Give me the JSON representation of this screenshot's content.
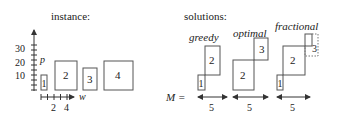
{
  "instance": {
    "title": "instance:",
    "y_axis": {
      "label": "p",
      "ticks": [
        "10",
        "20",
        "30"
      ]
    },
    "x_axis": {
      "label": "w",
      "ticks": [
        "2",
        "4"
      ]
    },
    "items": [
      {
        "id": "1",
        "w": 1,
        "p": 10
      },
      {
        "id": "2",
        "w": 4,
        "p": 20
      },
      {
        "id": "3",
        "w": 2,
        "p": 15
      },
      {
        "id": "4",
        "w": 5,
        "p": 20
      }
    ]
  },
  "solutions": {
    "title": "solutions:",
    "capacity_label": "M =",
    "panels": [
      {
        "name": "greedy",
        "items": [
          "1",
          "2"
        ],
        "capacity": "5"
      },
      {
        "name": "optimal",
        "items": [
          "2",
          "3"
        ],
        "capacity": "5"
      },
      {
        "name": "fractional",
        "items": [
          "1",
          "2",
          "3"
        ],
        "capacity": "5"
      }
    ]
  }
}
